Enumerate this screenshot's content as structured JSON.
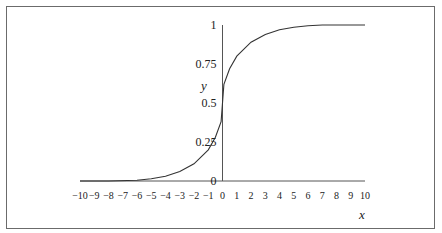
{
  "chart_data": {
    "type": "line",
    "title": "",
    "xlabel": "x",
    "ylabel": "y",
    "xlim": [
      -10,
      10
    ],
    "ylim": [
      0,
      1
    ],
    "x_ticks": [
      -10,
      -9,
      -8,
      -7,
      -6,
      -5,
      -4,
      -3,
      -2,
      -1,
      0,
      1,
      2,
      3,
      4,
      5,
      6,
      7,
      8,
      9,
      10
    ],
    "x_tick_labels": [
      "−10",
      "−9",
      "−8",
      "−7",
      "−6",
      "−5",
      "−4",
      "−3",
      "−2",
      "−1",
      "0",
      "1",
      "2",
      "3",
      "4",
      "5",
      "6",
      "7",
      "8",
      "9",
      "10"
    ],
    "y_ticks": [
      0,
      0.25,
      0.5,
      0.75,
      1
    ],
    "y_tick_labels": [
      "0",
      "0.25",
      "0.5",
      "0.75",
      "1"
    ],
    "grid": false,
    "legend": null,
    "series": [
      {
        "name": "curve",
        "x": [
          -10,
          -8,
          -6,
          -5,
          -4,
          -3,
          -2,
          -1,
          -0.5,
          -0.1,
          0,
          0.1,
          0.5,
          1,
          2,
          3,
          4,
          5,
          6,
          7,
          8,
          10
        ],
        "y": [
          0,
          0,
          0.005,
          0.015,
          0.03,
          0.06,
          0.11,
          0.2,
          0.28,
          0.38,
          0.5,
          0.62,
          0.72,
          0.8,
          0.89,
          0.94,
          0.97,
          0.985,
          0.995,
          1,
          1,
          1
        ]
      }
    ]
  }
}
